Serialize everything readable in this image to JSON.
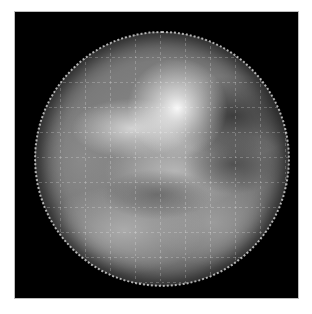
{
  "image": {
    "subject": "planet-disk",
    "description": "Grayscale image of a planetary disk with bright cloud features and a dotted latitude/longitude grid overlay on a black background",
    "colors": {
      "background": "#000000",
      "page": "#ffffff",
      "grid": "#e6e6e6"
    }
  }
}
